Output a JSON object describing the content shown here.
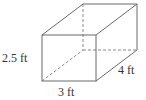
{
  "figure": {
    "type": "rectangular-prism",
    "labels": {
      "height": "2.5 ft",
      "width": "3 ft",
      "depth": "4 ft"
    },
    "colors": {
      "edge": "#6b6b6b",
      "hidden_edge": "#8a8a8a",
      "text": "#333333",
      "background": "#ffffff"
    }
  }
}
